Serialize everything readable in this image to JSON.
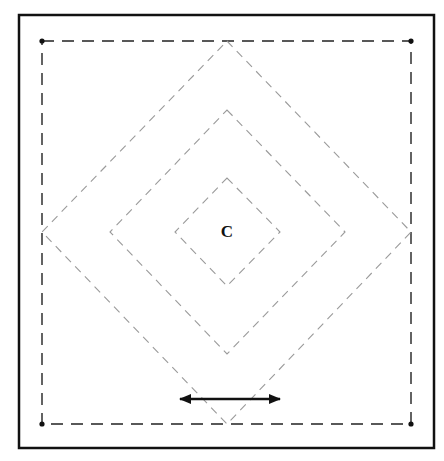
{
  "diagram": {
    "center_label": "C",
    "colors": {
      "frame": "#111111",
      "outer_dashed_square": "#222222",
      "diamonds": "#9a9a9a",
      "arrow": "#111111",
      "background": "#ffffff"
    },
    "frame": {
      "x": 19,
      "y": 15,
      "width": 415,
      "height": 433
    },
    "outer_square": {
      "corners": [
        [
          42,
          41
        ],
        [
          411,
          41
        ],
        [
          411,
          424
        ],
        [
          42,
          424
        ]
      ],
      "corner_dots": true
    },
    "center": [
      227,
      232
    ],
    "diamonds": [
      {
        "name": "large",
        "top": [
          227,
          41
        ],
        "right": [
          411,
          232
        ],
        "bottom": [
          227,
          424
        ],
        "left": [
          42,
          232
        ]
      },
      {
        "name": "middle",
        "top": [
          227,
          110
        ],
        "right": [
          345,
          232
        ],
        "bottom": [
          227,
          354
        ],
        "left": [
          110,
          232
        ]
      },
      {
        "name": "inner",
        "top": [
          227,
          178
        ],
        "right": [
          280,
          232
        ],
        "bottom": [
          227,
          286
        ],
        "left": [
          175,
          232
        ]
      }
    ],
    "double_arrow": {
      "x1": 174,
      "x2": 286,
      "y": 399
    }
  }
}
